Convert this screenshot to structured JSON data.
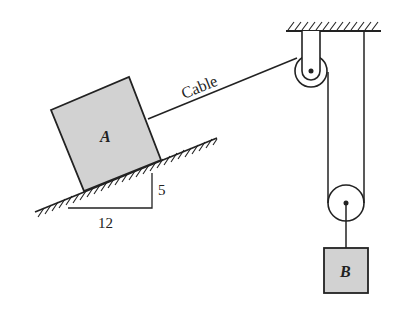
{
  "diagram": {
    "type": "pulley-incline-mechanics",
    "block_a": {
      "label": "A",
      "fill": "#d2d2d2"
    },
    "block_b": {
      "label": "B",
      "fill": "#d2d2d2"
    },
    "cable": {
      "label": "Cable"
    },
    "slope": {
      "rise": "5",
      "run": "12"
    },
    "stroke_color": "#222222"
  }
}
